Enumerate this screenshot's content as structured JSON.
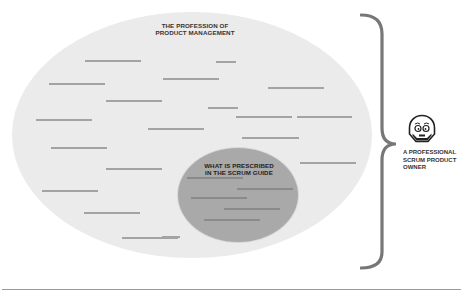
{
  "diagram": {
    "outer_ellipse": {
      "label_line1": "THE PROFESSION OF",
      "label_line2": "PRODUCT MANAGEMENT",
      "fill": "#ebebeb"
    },
    "inner_ellipse": {
      "label_line1": "WHAT IS PRESCRIBED",
      "label_line2": "IN THE SCRUM GUIDE",
      "fill": "#a9a9a9"
    },
    "brace": {
      "color": "#777777"
    },
    "person": {
      "icon": "product-owner-face-icon",
      "label_line1": "A PROFESSIONAL",
      "label_line2": "SCRUM PRODUCT",
      "label_line3": "OWNER"
    }
  },
  "placeholder_lines_outer": [
    {
      "x": 85,
      "y": 60,
      "w": 56
    },
    {
      "x": 216,
      "y": 61,
      "w": 20
    },
    {
      "x": 163,
      "y": 78,
      "w": 56
    },
    {
      "x": 49,
      "y": 83,
      "w": 56
    },
    {
      "x": 106,
      "y": 100,
      "w": 56
    },
    {
      "x": 208,
      "y": 107,
      "w": 30
    },
    {
      "x": 268,
      "y": 87,
      "w": 56
    },
    {
      "x": 36,
      "y": 119,
      "w": 56
    },
    {
      "x": 148,
      "y": 128,
      "w": 56
    },
    {
      "x": 236,
      "y": 116,
      "w": 56
    },
    {
      "x": 297,
      "y": 116,
      "w": 55
    },
    {
      "x": 51,
      "y": 147,
      "w": 56
    },
    {
      "x": 106,
      "y": 168,
      "w": 56
    },
    {
      "x": 242,
      "y": 137,
      "w": 57
    },
    {
      "x": 300,
      "y": 162,
      "w": 56
    },
    {
      "x": 42,
      "y": 190,
      "w": 56
    },
    {
      "x": 84,
      "y": 212,
      "w": 56
    },
    {
      "x": 122,
      "y": 237,
      "w": 56
    },
    {
      "x": 162,
      "y": 236,
      "w": 18
    }
  ],
  "placeholder_lines_inner": [
    {
      "x": 187,
      "y": 177,
      "w": 56
    },
    {
      "x": 237,
      "y": 188,
      "w": 56
    },
    {
      "x": 191,
      "y": 197,
      "w": 56
    },
    {
      "x": 224,
      "y": 208,
      "w": 56
    },
    {
      "x": 204,
      "y": 219,
      "w": 56
    }
  ]
}
